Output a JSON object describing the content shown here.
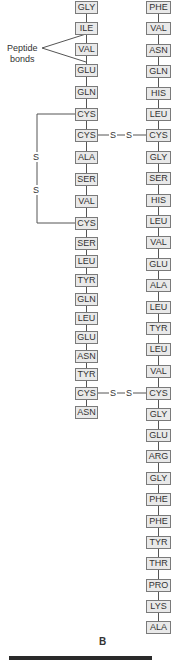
{
  "figure": {
    "caption": "B",
    "annotation": {
      "line1": "Peptide",
      "line2": "bonds"
    },
    "chain_a": {
      "residues": [
        "GLY",
        "ILE",
        "VAL",
        "GLU",
        "GLN",
        "CYS",
        "CYS",
        "ALA",
        "SER",
        "VAL",
        "CYS",
        "SER",
        "LEU",
        "TYR",
        "GLN",
        "LEU",
        "GLU",
        "ASN",
        "TYR",
        "CYS",
        "ASN"
      ],
      "y": [
        1,
        22,
        43,
        64,
        86,
        108,
        129,
        151,
        173,
        195,
        217,
        237,
        255,
        274,
        293,
        312,
        331,
        350,
        368,
        387,
        406
      ]
    },
    "chain_b": {
      "residues": [
        "PHE",
        "VAL",
        "ASN",
        "GLN",
        "HIS",
        "LEU",
        "CYS",
        "GLY",
        "SER",
        "HIS",
        "LEU",
        "VAL",
        "GLU",
        "ALA",
        "LEU",
        "TYR",
        "LEU",
        "VAL",
        "CYS",
        "GLY",
        "GLU",
        "ARG",
        "GLY",
        "PHE",
        "PHE",
        "TYR",
        "THR",
        "PRO",
        "LYS",
        "ALA"
      ],
      "y": [
        1,
        22,
        44,
        65,
        87,
        108,
        129,
        151,
        172,
        194,
        215,
        236,
        258,
        279,
        301,
        322,
        343,
        365,
        387,
        408,
        429,
        450,
        472,
        493,
        515,
        536,
        557,
        579,
        600,
        621
      ]
    },
    "disulfide_bonds": [
      {
        "type": "intra-chain",
        "from": "A6",
        "to": "A11",
        "labels": [
          "S",
          "S"
        ]
      },
      {
        "type": "inter-chain",
        "from": "A7",
        "to": "B7",
        "labels": [
          "S",
          "S"
        ]
      },
      {
        "type": "inter-chain",
        "from": "A20",
        "to": "B19",
        "labels": [
          "S",
          "S"
        ]
      }
    ]
  }
}
